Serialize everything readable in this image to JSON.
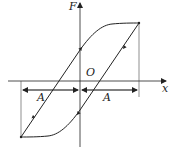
{
  "diagram": {
    "axes": {
      "y_label": "F",
      "x_label": "x",
      "origin_label": "O"
    },
    "dimensions": [
      {
        "label": "A",
        "from": "-A",
        "to": "O"
      },
      {
        "label": "A",
        "from": "O",
        "to": "A"
      }
    ],
    "colors": {
      "line": "#222222",
      "background": "#ffffff"
    }
  }
}
